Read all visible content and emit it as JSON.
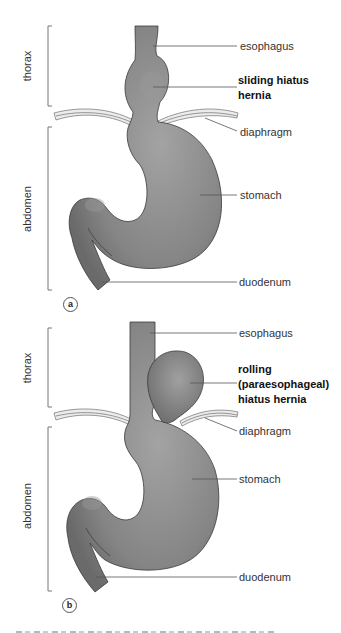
{
  "figure": {
    "panels": [
      {
        "id": "a",
        "badge": "a",
        "regions": {
          "upper": "thorax",
          "lower": "abdomen"
        },
        "labels": {
          "esophagus": "esophagus",
          "hernia_line1": "sliding hiatus",
          "hernia_line2": "hernia",
          "diaphragm": "diaphragm",
          "stomach": "stomach",
          "duodenum": "duodenum"
        }
      },
      {
        "id": "b",
        "badge": "b",
        "regions": {
          "upper": "thorax",
          "lower": "abdomen"
        },
        "labels": {
          "esophagus": "esophagus",
          "hernia_line1": "rolling",
          "hernia_line2": "(paraesophageal)",
          "hernia_line3": "hiatus hernia",
          "diaphragm": "diaphragm",
          "stomach": "stomach",
          "duodenum": "duodenum"
        }
      }
    ],
    "colors": {
      "organ_fill": "#7a7a7a",
      "organ_highlight": "#9a9a9a",
      "outline": "#3a3a3a",
      "leader_line": "#555555",
      "bracket": "#777777"
    }
  }
}
